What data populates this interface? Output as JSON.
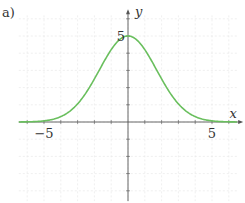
{
  "panel_label": "a)",
  "chart_data": {
    "type": "line",
    "title": "",
    "xlabel": "x",
    "ylabel": "y",
    "xlim": [
      -6.5,
      6.5
    ],
    "ylim": [
      -4.6,
      6.2
    ],
    "grid": true,
    "legend": "none",
    "x_tick_labels": [
      {
        "value": -5,
        "label": "−5"
      },
      {
        "value": 5,
        "label": "5"
      }
    ],
    "y_tick_labels": [
      {
        "value": 5,
        "label": "5"
      }
    ],
    "series": [
      {
        "name": "gaussian",
        "color": "#6abf5e",
        "formula": "5*exp(-x^2/(2*1.7^2))",
        "x": [
          -6.5,
          -6,
          -5,
          -4,
          -3,
          -2,
          -1.5,
          -1,
          -0.5,
          0,
          0.5,
          1,
          1.5,
          2,
          3,
          4,
          5,
          6,
          6.5
        ],
        "y": [
          0.0,
          0.01,
          0.07,
          0.31,
          1.05,
          2.5,
          3.39,
          4.21,
          4.79,
          5.0,
          4.79,
          4.21,
          3.39,
          2.5,
          1.05,
          0.31,
          0.07,
          0.01,
          0.0
        ]
      }
    ]
  },
  "colors": {
    "axis": "#555555",
    "grid": "#e4e4e4",
    "curve": "#6abf5e",
    "text": "#333333"
  }
}
